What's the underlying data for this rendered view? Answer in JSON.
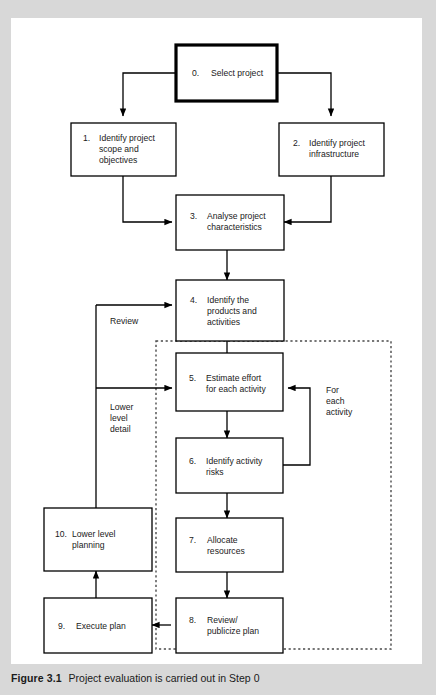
{
  "figure": {
    "caption_label": "Figure 3.1",
    "caption_text": "Project evaluation is carried out in Step 0",
    "background_color": "#d8d8d8",
    "panel_color": "#ffffff",
    "line_color": "#000000"
  },
  "diagram": {
    "type": "flowchart",
    "title": "Project evaluation is carried out in Step 0",
    "nodes": [
      {
        "id": "n0",
        "number": "0.",
        "line1": "Select project",
        "line2": "",
        "line3": "",
        "emphasis": "bold"
      },
      {
        "id": "n1",
        "number": "1.",
        "line1": "Identify project",
        "line2": "scope and",
        "line3": "objectives",
        "emphasis": "normal"
      },
      {
        "id": "n2",
        "number": "2.",
        "line1": "Identify project",
        "line2": "infrastructure",
        "line3": "",
        "emphasis": "normal"
      },
      {
        "id": "n3",
        "number": "3.",
        "line1": "Analyse project",
        "line2": "characteristics",
        "line3": "",
        "emphasis": "normal"
      },
      {
        "id": "n4",
        "number": "4.",
        "line1": "Identify the",
        "line2": "products and",
        "line3": "activities",
        "emphasis": "normal"
      },
      {
        "id": "n5",
        "number": "5.",
        "line1": "Estimate effort",
        "line2": "for each activity",
        "line3": "",
        "emphasis": "normal"
      },
      {
        "id": "n6",
        "number": "6.",
        "line1": "Identify activity",
        "line2": "risks",
        "line3": "",
        "emphasis": "normal"
      },
      {
        "id": "n7",
        "number": "7.",
        "line1": "Allocate",
        "line2": "resources",
        "line3": "",
        "emphasis": "normal"
      },
      {
        "id": "n8",
        "number": "8.",
        "line1": "Review/",
        "line2": "publicize plan",
        "line3": "",
        "emphasis": "normal"
      },
      {
        "id": "n9",
        "number": "9.",
        "line1": "Execute plan",
        "line2": "",
        "line3": "",
        "emphasis": "normal"
      },
      {
        "id": "n10",
        "number": "10.",
        "line1": "Lower level",
        "line2": "planning",
        "line3": "",
        "emphasis": "normal"
      }
    ],
    "annotations": [
      {
        "id": "a-review",
        "line1": "Review",
        "line2": "",
        "line3": ""
      },
      {
        "id": "a-lower",
        "line1": "Lower",
        "line2": "level",
        "line3": "detail"
      },
      {
        "id": "a-foreach",
        "line1": "For",
        "line2": "each",
        "line3": "activity"
      }
    ],
    "edges": [
      {
        "from": "n0",
        "to": "n1"
      },
      {
        "from": "n0",
        "to": "n2"
      },
      {
        "from": "n1",
        "to": "n3"
      },
      {
        "from": "n2",
        "to": "n3"
      },
      {
        "from": "n3",
        "to": "n4"
      },
      {
        "from": "n4",
        "to": "n5"
      },
      {
        "from": "n5",
        "to": "n6"
      },
      {
        "from": "n6",
        "to": "n5",
        "label": "For each activity"
      },
      {
        "from": "n6",
        "to": "n7"
      },
      {
        "from": "n7",
        "to": "n8"
      },
      {
        "from": "n8",
        "to": "n9"
      },
      {
        "from": "n9",
        "to": "n10"
      },
      {
        "from": "n10",
        "to": "n4",
        "label": "Review"
      },
      {
        "from": "n10",
        "to": "n5",
        "label": "Lower level detail"
      }
    ],
    "group_box": {
      "label": "",
      "style": "dashed"
    }
  }
}
